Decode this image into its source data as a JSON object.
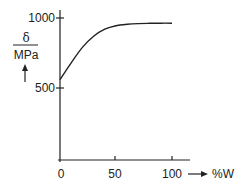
{
  "chart_data": {
    "type": "line",
    "title": "",
    "xlabel": "%W",
    "ylabel_num": "δ",
    "ylabel_den": "MPa",
    "x_ticks": [
      0,
      50,
      100
    ],
    "y_ticks": [
      500,
      1000
    ],
    "xlim": [
      0,
      100
    ],
    "ylim": [
      500,
      1000
    ],
    "grid": false,
    "series": [
      {
        "name": "δ",
        "x": [
          0,
          10,
          20,
          30,
          40,
          50,
          60,
          70,
          80,
          90,
          100
        ],
        "values": [
          560,
          680,
          790,
          870,
          920,
          945,
          955,
          960,
          962,
          963,
          963
        ]
      }
    ]
  },
  "labels": {
    "y_num": "δ",
    "y_den": "MPa",
    "x_unit": "%W",
    "tick_x0": "0",
    "tick_x50": "50",
    "tick_x100": "100",
    "tick_y500": "500",
    "tick_y1000": "1000"
  }
}
